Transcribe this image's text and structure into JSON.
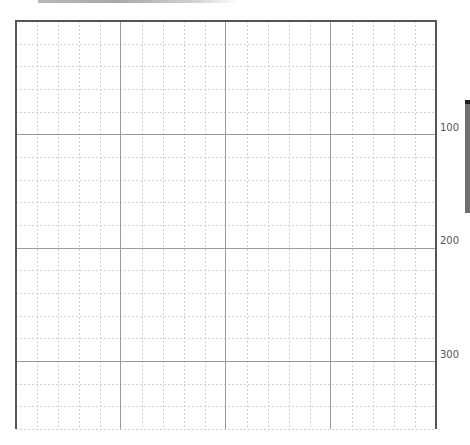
{
  "grid": {
    "origin_x": 16,
    "origin_y": 21,
    "right_x": 436,
    "bottom_y": 429,
    "major_step_x": 105,
    "major_step_y": 113.3,
    "minor_divisions": 5,
    "major_color": "#9a9a9a",
    "minor_color": "#cfcfcf",
    "border_color": "#555555"
  },
  "axis_labels": [
    {
      "text": "100",
      "top": 122
    },
    {
      "text": "200",
      "top": 235
    },
    {
      "text": "300",
      "top": 349
    }
  ],
  "scrollbar": {
    "thumb_color": "#6f6f6f",
    "cap_color": "#1e1e1e"
  }
}
